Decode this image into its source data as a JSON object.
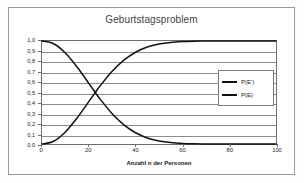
{
  "chart_data": {
    "type": "line",
    "title": "Geburtstagsproblem",
    "xlabel": "Anzahl n der Personen",
    "ylabel": "Wahrscheinlichkeit",
    "xlim": [
      0,
      100
    ],
    "ylim": [
      0,
      1
    ],
    "grid": true,
    "legend_position": "center-right",
    "x_ticks": [
      "0",
      "20",
      "40",
      "60",
      "80",
      "100"
    ],
    "x_tick_values": [
      0,
      20,
      40,
      60,
      80,
      100
    ],
    "y_ticks": [
      "0,0",
      "0,1",
      "0,2",
      "0,3",
      "0,4",
      "0,5",
      "0,6",
      "0,7",
      "0,8",
      "0,9",
      "1,0"
    ],
    "y_tick_values": [
      0,
      0.1,
      0.2,
      0.3,
      0.4,
      0.5,
      0.6,
      0.7,
      0.8,
      0.9,
      1.0
    ],
    "x": [
      0,
      5,
      10,
      15,
      20,
      23,
      25,
      30,
      35,
      40,
      45,
      50,
      55,
      60,
      65,
      70,
      75,
      80,
      85,
      90,
      95,
      100
    ],
    "series": [
      {
        "name": "P(E')",
        "color": "#111111",
        "values": [
          1.0,
          0.973,
          0.883,
          0.747,
          0.589,
          0.493,
          0.431,
          0.294,
          0.186,
          0.109,
          0.059,
          0.03,
          0.014,
          0.006,
          0.002,
          0.001,
          0.0003,
          0.0001,
          3e-05,
          1e-05,
          3e-06,
          3e-07
        ]
      },
      {
        "name": "P(E)",
        "color": "#111111",
        "values": [
          0.0,
          0.027,
          0.117,
          0.253,
          0.411,
          0.507,
          0.569,
          0.706,
          0.814,
          0.891,
          0.941,
          0.97,
          0.986,
          0.994,
          0.998,
          0.999,
          0.9997,
          0.9999,
          0.99997,
          0.99999,
          0.999997,
          0.9999997
        ]
      }
    ],
    "crossing_point": {
      "x": 23,
      "y": 0.5
    }
  },
  "legend": {
    "entries": [
      {
        "label": "P(E')"
      },
      {
        "label": "P(E)"
      }
    ]
  },
  "colors": {
    "curve": "#111111",
    "grid": "#8d8d8d",
    "axis": "#6d6d6d",
    "frame": "#9a9a9a",
    "title_text": "#3f3f3f"
  }
}
